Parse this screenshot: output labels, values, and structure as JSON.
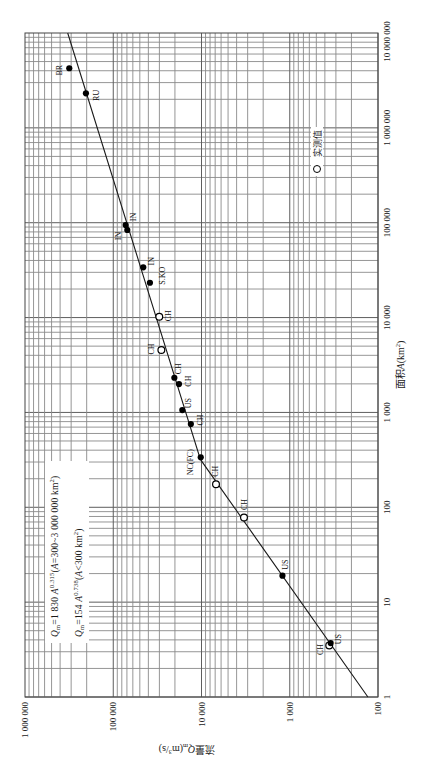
{
  "figure": {
    "y_axis_title": {
      "text": "流量",
      "var": "Q",
      "sub": "m",
      "unit": "(m",
      "unit_sup": "3",
      "unit_end": "/s)"
    },
    "x_axis_title": {
      "text": "面积",
      "var": "A",
      "unit": "(km",
      "unit_sup": "2",
      "unit_end": ")"
    },
    "legend": {
      "marker": "open-circle",
      "label": "实测值"
    },
    "equations": [
      {
        "var": "Q",
        "sub": "m",
        "coef": "=1 830 ",
        "base": "A",
        "exp": "0.315",
        "cond_open": "(",
        "cond_var": "A",
        "cond": "=300~3 000 000 km",
        "cond_sup": "2",
        "cond_close": ")"
      },
      {
        "var": "Q",
        "sub": "m",
        "coef": "=154 ",
        "base": "A",
        "exp": "0.738",
        "cond_open": "(",
        "cond_var": "A",
        "cond": "<300 km",
        "cond_sup": "2",
        "cond_close": ")"
      }
    ]
  },
  "chart_data": {
    "type": "scatter",
    "title": "",
    "orientation": "rotated 90° counter-clockwise",
    "xlabel": "面积A(km²)",
    "ylabel": "流量Q_m(m³/s)",
    "xscale": "log",
    "yscale": "log",
    "xlim": [
      1,
      10000000
    ],
    "ylim": [
      100,
      1000000
    ],
    "x_ticks": [
      1,
      10,
      100,
      1000,
      10000,
      100000,
      1000000,
      10000000
    ],
    "x_tick_labels": [
      "1",
      "10",
      "100",
      "1 000",
      "10 000",
      "100 000",
      "1 000 000",
      "10 000 000"
    ],
    "y_ticks": [
      100,
      1000,
      10000,
      100000,
      1000000
    ],
    "y_tick_labels": [
      "100",
      "1 000",
      "10 000",
      "100 000",
      "1 000 000"
    ],
    "grid": true,
    "legend": [
      {
        "marker": "open circle",
        "label": "实测值"
      }
    ],
    "points": [
      {
        "label": "BR",
        "area_km2": 4250000,
        "q_m3s": 315000,
        "marker": "filled",
        "label_dx": -2,
        "label_dy": -10
      },
      {
        "label": "RU",
        "area_km2": 2310000,
        "q_m3s": 204000,
        "marker": "filled",
        "label_dx": -2,
        "label_dy": 10
      },
      {
        "label": "IN",
        "area_km2": 94600,
        "q_m3s": 72300,
        "marker": "filled",
        "label_dx": 8,
        "label_dy": 8
      },
      {
        "label": "IN",
        "area_km2": 83800,
        "q_m3s": 69300,
        "marker": "filled",
        "label_dx": -6,
        "label_dy": -9
      },
      {
        "label": "IN",
        "area_km2": 33900,
        "q_m3s": 45700,
        "marker": "filled",
        "label_dx": 6,
        "label_dy": 8
      },
      {
        "label": "S.KO",
        "area_km2": 23300,
        "q_m3s": 38400,
        "marker": "filled",
        "label_dx": 7,
        "label_dy": 12
      },
      {
        "label": "CH",
        "area_km2": 10200,
        "q_m3s": 30100,
        "marker": "open",
        "label_dx": 1,
        "label_dy": 9
      },
      {
        "label": "CH",
        "area_km2": 4550,
        "q_m3s": 28500,
        "marker": "open",
        "label_dx": 1,
        "label_dy": -10
      },
      {
        "label": "CH",
        "area_km2": 2320,
        "q_m3s": 20300,
        "marker": "filled",
        "label_dx": 9,
        "label_dy": 4
      },
      {
        "label": "CH",
        "area_km2": 1990,
        "q_m3s": 18000,
        "marker": "filled",
        "label_dx": 3,
        "label_dy": 9
      },
      {
        "label": "US",
        "area_km2": 1060,
        "q_m3s": 16500,
        "marker": "filled",
        "label_dx": 7,
        "label_dy": 6
      },
      {
        "label": "CH",
        "area_km2": 755,
        "q_m3s": 13200,
        "marker": "filled",
        "label_dx": 4,
        "label_dy": 9
      },
      {
        "label": "NC(FC)",
        "area_km2": 337,
        "q_m3s": 10200,
        "marker": "filled",
        "label_dx": -5,
        "label_dy": -11
      },
      {
        "label": "CH",
        "area_km2": 175,
        "q_m3s": 6850,
        "marker": "open",
        "label_dx": 13,
        "label_dy": -1
      },
      {
        "label": "CH",
        "area_km2": 78,
        "q_m3s": 3300,
        "marker": "open",
        "label_dx": 13,
        "label_dy": 0
      },
      {
        "label": "US",
        "area_km2": 19,
        "q_m3s": 1210,
        "marker": "filled",
        "label_dx": 11,
        "label_dy": 3
      },
      {
        "label": "US",
        "area_km2": 3.7,
        "q_m3s": 344,
        "marker": "filled",
        "label_dx": 4,
        "label_dy": 8
      },
      {
        "label": "CH",
        "area_km2": 3.5,
        "q_m3s": 357,
        "marker": "open",
        "label_dx": -4,
        "label_dy": -9
      }
    ],
    "fit_line": {
      "type": "piecewise power law",
      "points": [
        [
          1,
          130
        ],
        [
          320,
          10300
        ],
        [
          10000000,
          328000
        ]
      ],
      "segments": [
        {
          "equation": "Q_m=154 A^0.738",
          "range": "A<300 km²"
        },
        {
          "equation": "Q_m=1 830 A^0.315",
          "range": "A=300~3 000 000 km²"
        }
      ]
    },
    "annotations": [
      "Q_m=1 830 A^0.315 (A=300~3 000 000 km²)",
      "Q_m=154 A^0.738 (A<300 km²)"
    ]
  }
}
